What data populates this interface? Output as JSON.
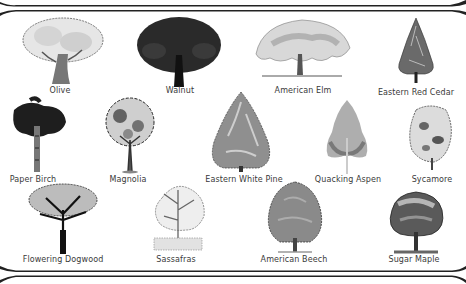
{
  "poster": {
    "colors": {
      "ink": "#1a1a1a",
      "frame": "#222222",
      "label": "#3a3a3a",
      "background": "#ffffff"
    },
    "trees": [
      {
        "id": "olive",
        "label": "Olive"
      },
      {
        "id": "walnut",
        "label": "Walnut"
      },
      {
        "id": "american-elm",
        "label": "American Elm"
      },
      {
        "id": "eastern-red-cedar",
        "label": "Eastern Red Cedar"
      },
      {
        "id": "paper-birch",
        "label": "Paper Birch"
      },
      {
        "id": "magnolia",
        "label": "Magnolia"
      },
      {
        "id": "eastern-white-pine",
        "label": "Eastern White Pine"
      },
      {
        "id": "quacking-aspen",
        "label": "Quacking Aspen"
      },
      {
        "id": "sycamore",
        "label": "Sycamore"
      },
      {
        "id": "flowering-dogwood",
        "label": "Flowering Dogwood"
      },
      {
        "id": "sassafras",
        "label": "Sassafras"
      },
      {
        "id": "american-beech",
        "label": "American Beech"
      },
      {
        "id": "sugar-maple",
        "label": "Sugar Maple"
      }
    ]
  }
}
